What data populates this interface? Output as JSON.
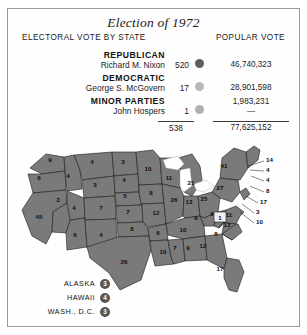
{
  "title": "Election of 1972",
  "columns": {
    "electoral": "ELECTORAL VOTE BY STATE",
    "popular": "POPULAR VOTE"
  },
  "colors": {
    "republican": "#5e5e5e",
    "democratic": "#b8b8b8",
    "minor": "#b0b0b0",
    "map_fill": "#7a7a7a",
    "border": "#9a9a9a",
    "faithless_fill": "#f0f0f0"
  },
  "legend": {
    "rows": [
      {
        "party": "REPUBLICAN",
        "candidate": "Richard M. Nixon",
        "electoral": "520",
        "popular": "46,740,323",
        "dot": "republican-dot"
      },
      {
        "party": "DEMOCRATIC",
        "candidate": "George S. McGovern",
        "electoral": "17",
        "popular": "28,901,598",
        "dot": "democratic-dot"
      },
      {
        "party": "MINOR PARTIES",
        "candidate": "John Hospers",
        "electoral": "1",
        "popular": "1,983,231",
        "popular_second": "—",
        "dot": "minor-parties-dot"
      }
    ],
    "totals": {
      "electoral": "538",
      "popular": "77,625,152"
    }
  },
  "insets": [
    {
      "name": "ALASKA",
      "votes": "3"
    },
    {
      "name": "HAWAII",
      "votes": "4"
    },
    {
      "name": "WASH., D.C.",
      "votes": "3"
    }
  ],
  "chart_data": {
    "type": "map",
    "title": "Election of 1972",
    "subtitle": "ELECTORAL VOTE BY STATE",
    "legend_position": "top",
    "note": "Electoral votes by state; shaded states won by Nixon (Republican). Virginia shown unshaded for faithless elector.",
    "states": [
      {
        "code": "WA",
        "votes": 9,
        "x": 42,
        "y": 22
      },
      {
        "code": "OR",
        "votes": 6,
        "x": 31,
        "y": 40
      },
      {
        "code": "CA",
        "votes": 45,
        "x": 31,
        "y": 79
      },
      {
        "code": "NV",
        "votes": 3,
        "x": 50,
        "y": 62
      },
      {
        "code": "ID",
        "votes": 4,
        "x": 60,
        "y": 38
      },
      {
        "code": "MT",
        "votes": 4,
        "x": 84,
        "y": 24
      },
      {
        "code": "WY",
        "votes": 3,
        "x": 87,
        "y": 47
      },
      {
        "code": "UT",
        "votes": 4,
        "x": 66,
        "y": 70
      },
      {
        "code": "AZ",
        "votes": 6,
        "x": 67,
        "y": 97
      },
      {
        "code": "CO",
        "votes": 7,
        "x": 93,
        "y": 70
      },
      {
        "code": "NM",
        "votes": 4,
        "x": 93,
        "y": 97
      },
      {
        "code": "ND",
        "votes": 3,
        "x": 115,
        "y": 24
      },
      {
        "code": "SD",
        "votes": 4,
        "x": 116,
        "y": 42
      },
      {
        "code": "NE",
        "votes": 5,
        "x": 117,
        "y": 58
      },
      {
        "code": "KS",
        "votes": 7,
        "x": 120,
        "y": 74
      },
      {
        "code": "OK",
        "votes": 8,
        "x": 124,
        "y": 91
      },
      {
        "code": "TX",
        "votes": 26,
        "x": 116,
        "y": 124
      },
      {
        "code": "MN",
        "votes": 10,
        "x": 140,
        "y": 31
      },
      {
        "code": "IA",
        "votes": 8,
        "x": 143,
        "y": 55
      },
      {
        "code": "MO",
        "votes": 12,
        "x": 148,
        "y": 75
      },
      {
        "code": "AR",
        "votes": 6,
        "x": 150,
        "y": 95
      },
      {
        "code": "LA",
        "votes": 10,
        "x": 155,
        "y": 114
      },
      {
        "code": "WI",
        "votes": 11,
        "x": 161,
        "y": 40
      },
      {
        "code": "IL",
        "votes": 26,
        "x": 166,
        "y": 62
      },
      {
        "code": "MS",
        "votes": 7,
        "x": 167,
        "y": 110
      },
      {
        "code": "MI",
        "votes": 21,
        "x": 183,
        "y": 45
      },
      {
        "code": "IN",
        "votes": 13,
        "x": 181,
        "y": 64
      },
      {
        "code": "TN",
        "votes": 10,
        "x": 175,
        "y": 92
      },
      {
        "code": "AL",
        "votes": 9,
        "x": 180,
        "y": 110
      },
      {
        "code": "OH",
        "votes": 25,
        "x": 196,
        "y": 61
      },
      {
        "code": "KY",
        "votes": 9,
        "x": 188,
        "y": 80
      },
      {
        "code": "GA",
        "votes": 12,
        "x": 195,
        "y": 108
      },
      {
        "code": "WV",
        "votes": 6,
        "x": 204,
        "y": 76
      },
      {
        "code": "FL",
        "votes": 17,
        "x": 212,
        "y": 131
      },
      {
        "code": "SC",
        "votes": 8,
        "x": 208,
        "y": 96
      },
      {
        "code": "PA",
        "votes": 27,
        "x": 212,
        "y": 50
      },
      {
        "code": "NY",
        "votes": 41,
        "x": 216,
        "y": 28
      },
      {
        "code": "VA",
        "votes": 11,
        "x": 221,
        "y": 77
      },
      {
        "code": "NC",
        "votes": 13,
        "x": 219,
        "y": 87
      }
    ],
    "faithless": {
      "code": "VA-elector",
      "votes": 1,
      "x": 213,
      "y": 77
    },
    "leader_labels": [
      {
        "votes": 14,
        "x": 258,
        "y": 22
      },
      {
        "votes": 4,
        "x": 258,
        "y": 32
      },
      {
        "votes": 4,
        "x": 258,
        "y": 42
      },
      {
        "votes": 8,
        "x": 258,
        "y": 53
      },
      {
        "votes": 17,
        "x": 252,
        "y": 64
      },
      {
        "votes": 3,
        "x": 248,
        "y": 74
      },
      {
        "votes": 10,
        "x": 248,
        "y": 84
      }
    ],
    "insets": [
      {
        "name": "ALASKA",
        "votes": 3
      },
      {
        "name": "HAWAII",
        "votes": 4
      },
      {
        "name": "WASH., D.C.",
        "votes": 3
      }
    ]
  }
}
